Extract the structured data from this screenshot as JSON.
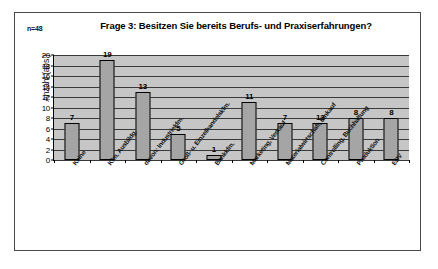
{
  "chart_data": {
    "type": "bar",
    "title": "Frage 3: Besitzen Sie bereits Berufs- und Praxiserfahrungen?",
    "annotation": "n=48",
    "xlabel": "",
    "ylabel": "Anzahl (abs.)",
    "ylim": [
      0,
      20
    ],
    "ytick_step": 2,
    "yticks": [
      "20",
      "18",
      "16",
      "14",
      "12",
      "10",
      "8",
      "6",
      "4",
      "2",
      "0"
    ],
    "grid": true,
    "legend": "none",
    "categories": [
      "Keine",
      "Kfm. Ausbildg.",
      "davon: Industriekfm.",
      "Groß- u. Einzelhandelskfm.",
      "Bankkfm.",
      "Marketing, Verkauf",
      "Materialwirtschaft, Einkauf",
      "Controlling, Buchhaltung",
      "Produktion",
      "EDV"
    ],
    "values": [
      7,
      19,
      13,
      5,
      1,
      11,
      7,
      7,
      8,
      8
    ],
    "data_labels": [
      "7",
      "19",
      "13",
      "5",
      "1",
      "11",
      "7",
      "13",
      "8",
      "8"
    ],
    "colors": {
      "bar_fill": "#a5a5a5",
      "bar_stroke": "#000000",
      "plot_background": "#c6c6c6",
      "gridline": "#3a3a3a",
      "frame": "#4a4a4a",
      "page_background": "#ffffff",
      "text": "#000000"
    }
  }
}
